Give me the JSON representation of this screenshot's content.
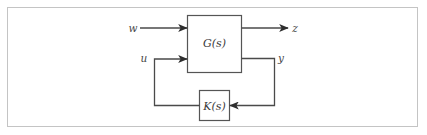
{
  "diagram": {
    "type": "feedback-block-diagram",
    "blocks": [
      {
        "id": "plant",
        "label": "G(s)"
      },
      {
        "id": "controller",
        "label": "K(s)"
      }
    ],
    "signals": [
      {
        "id": "w",
        "label": "w",
        "from": "external",
        "to": "plant",
        "role": "exogenous input"
      },
      {
        "id": "z",
        "label": "z",
        "from": "plant",
        "to": "external",
        "role": "performance output"
      },
      {
        "id": "u",
        "label": "u",
        "from": "controller",
        "to": "plant",
        "role": "control input"
      },
      {
        "id": "y",
        "label": "y",
        "from": "plant",
        "to": "controller",
        "role": "measured output"
      }
    ],
    "colors": {
      "line": "#4a4a4a",
      "frame": "#c4c4c4",
      "text": "#3a3a3a"
    }
  }
}
